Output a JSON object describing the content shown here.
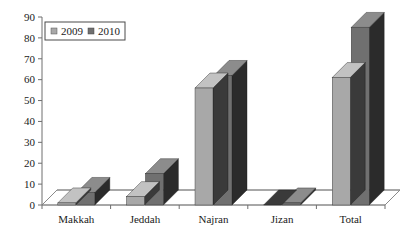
{
  "chart_data": {
    "type": "bar",
    "title": "",
    "subtitle": "",
    "xlabel": "",
    "ylabel": "",
    "categories": [
      "Makkah",
      "Jeddah",
      "Najran",
      "Jizan",
      "Total"
    ],
    "series": [
      {
        "name": "2009",
        "values": [
          1,
          4,
          56,
          0,
          61
        ],
        "color": "#a8a8a8"
      },
      {
        "name": "2010",
        "values": [
          6,
          15,
          62,
          1,
          85
        ],
        "color": "#707070"
      }
    ],
    "ylim": [
      0,
      90
    ],
    "ytick_step": 10,
    "ytick_labels": [
      "0",
      "10",
      "20",
      "30",
      "40",
      "50",
      "60",
      "70",
      "80",
      "90"
    ],
    "grid": false,
    "legend_position": "top-left",
    "style": "3d-column",
    "annotations": []
  },
  "legend": {
    "items": [
      {
        "label": "2009",
        "swatch": "legend-swatch-2009"
      },
      {
        "label": "2010",
        "swatch": "legend-swatch-2010"
      }
    ]
  },
  "colors": {
    "series_2009": "#a8a8a8",
    "series_2009_top": "#c2c2c2",
    "series_2009_side": "#3a3a3a",
    "series_2010": "#707070",
    "series_2010_top": "#8c8c8c",
    "series_2010_side": "#2b2b2b",
    "axis": "#6e6e6e",
    "floor": "#8a8a8a",
    "background": "#ffffff",
    "text": "#1a1a1a"
  }
}
